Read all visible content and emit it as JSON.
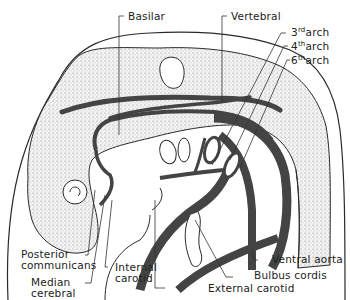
{
  "figure": {
    "colors": {
      "background": "#ffffff",
      "outline": "#2a2a2a",
      "vessel": "#444444",
      "stipple": "#c8c8c8"
    }
  },
  "labels": {
    "basilar": "Basilar",
    "vertebral": "Vertebral",
    "arch3_num": "3",
    "arch3_sup": "rd",
    "arch4_num": "4",
    "arch4_sup": "th",
    "arch6_num": "6",
    "arch6_sup": "th",
    "arch_word": "arch",
    "posterior_communicans_1": "Posterior",
    "posterior_communicans_2": "communicans",
    "median_cerebral_1": "Median",
    "median_cerebral_2": "cerebral",
    "internal_carotid_1": "Internal",
    "internal_carotid_2": "carotid",
    "external_carotid": "External carotid",
    "bulbus_cordis": "Bulbus cordis",
    "ventral_aorta": "Ventral aorta"
  }
}
